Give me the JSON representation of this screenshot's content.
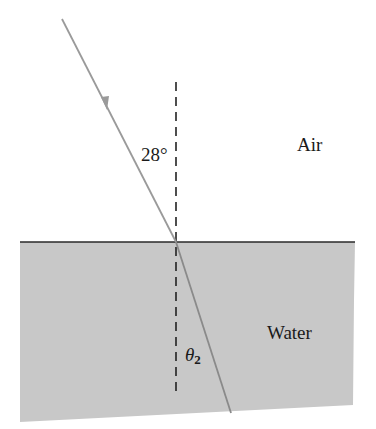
{
  "figure": {
    "media": {
      "upper": "Air",
      "lower": "Water"
    },
    "angles": {
      "incident": "28°",
      "refracted_symbol": "θ",
      "refracted_subscript": "2"
    },
    "elements": {
      "incident_ray": {
        "from": [
          62,
          19
        ],
        "to": [
          176,
          242
        ],
        "has_arrow": true
      },
      "refracted_ray": {
        "from": [
          176,
          242
        ],
        "to": [
          231,
          413
        ]
      },
      "normal_line": {
        "x": 176,
        "y_top": 82,
        "y_bottom": 395,
        "style": "dashed"
      },
      "interface_line": {
        "y": 242,
        "x_left": 20,
        "x_right": 355
      }
    },
    "colors": {
      "background": "#ffffff",
      "water_fill": "#c8c8c8",
      "ray": "#9a9a9a",
      "interface": "#2a2a2a",
      "normal": "#222222",
      "text": "#1a1a1a"
    }
  }
}
